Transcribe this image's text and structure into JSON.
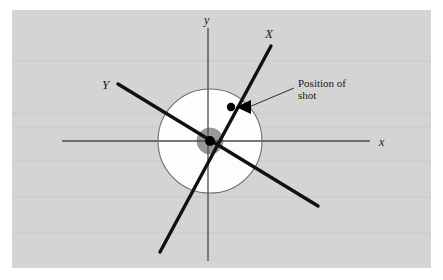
{
  "figure": {
    "kind": "target-shot-diagram",
    "canvas": {
      "width": 443,
      "height": 280
    },
    "panel": {
      "name": "figure-panel",
      "x": 12,
      "y": 10,
      "width": 419,
      "height": 258,
      "fill": "#d4d4d4"
    },
    "background_color": "#ffffff",
    "ink_color": "#1a1a1a",
    "axis_color": "#4a4a4a",
    "circle_outline_color": "#6e6e6e",
    "target_fill_color": "#fdfdfd",
    "bullseye_fill_color": "#9a9a9a",
    "center_dot_color": "#000000"
  },
  "axes": {
    "x_axis": {
      "label": "x",
      "x1": 62,
      "y1": 141,
      "x2": 370,
      "y2": 141,
      "label_x": 379,
      "label_y": 146
    },
    "y_axis": {
      "label": "y",
      "x1": 208,
      "y1": 28,
      "x2": 208,
      "y2": 261,
      "label_x": 204,
      "label_y": 24
    }
  },
  "target": {
    "center_x": 210,
    "center_y": 141,
    "outer_radius": 52,
    "bullseye_radius": 13,
    "center_dot_radius": 5
  },
  "principal_axes": [
    {
      "label": "X",
      "name": "axis-X",
      "x1": 271,
      "y1": 46,
      "x2": 160,
      "y2": 252,
      "label_x": 265,
      "label_y": 38
    },
    {
      "label": "Y",
      "name": "axis-Y",
      "x1": 118,
      "y1": 84,
      "x2": 318,
      "y2": 206,
      "label_x": 104,
      "label_y": 89
    }
  ],
  "shot": {
    "marker_x": 231,
    "marker_y": 107,
    "marker_radius": 4,
    "arrow_tip_x": 237,
    "arrow_tip_y": 107,
    "arrow_back_x": 250,
    "arrow_back_y": 101,
    "arrow_back2_x": 250,
    "arrow_back2_y": 113,
    "leader_x1": 249,
    "leader_y1": 107,
    "leader_x2": 294,
    "leader_y2": 88
  },
  "callout": {
    "line1": "Position of",
    "line2": "shot",
    "line1_x": 298,
    "line1_y": 87,
    "line2_x": 298,
    "line2_y": 99,
    "font_size": 11
  }
}
